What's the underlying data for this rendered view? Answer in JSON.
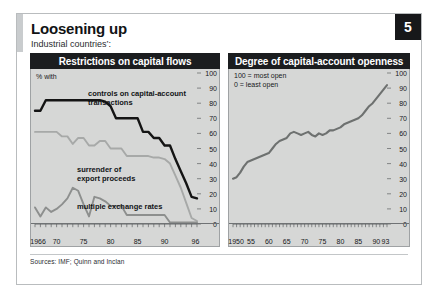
{
  "page": {
    "badge": "5",
    "title": "Loosening up",
    "subtitle": "Industrial countries’:",
    "source": "Sources: IMF; Quinn and Inclan"
  },
  "panels": {
    "left": {
      "header": "Restrictions on capital flows",
      "unit_note": "% with",
      "labels": {
        "controls": "controls on capital-account\ntransactions",
        "surrender": "surrender of\nexport proceeds",
        "multiple": "multiple exchange rates"
      }
    },
    "right": {
      "header": "Degree of capital-account openness",
      "scale_note": "100 = most open\n0 = least open"
    }
  },
  "chart_data": [
    {
      "type": "line",
      "title": "Restrictions on capital flows",
      "subtitle": "Industrial countries’:",
      "xlabel": "",
      "ylabel": "% with",
      "xlim": [
        1966,
        1996
      ],
      "ylim": [
        0,
        100
      ],
      "xticks": [
        1966,
        1970,
        1975,
        1980,
        1985,
        1990,
        1996
      ],
      "xtick_labels": [
        "1966",
        "70",
        "75",
        "80",
        "85",
        "90",
        "96"
      ],
      "yticks": [
        0,
        10,
        20,
        30,
        40,
        50,
        60,
        70,
        80,
        90,
        100
      ],
      "ytick_labels": [
        "0",
        "10",
        "20",
        "30",
        "40",
        "50",
        "60",
        "70",
        "80",
        "90",
        "100"
      ],
      "grid": false,
      "legend": "inline-annotations",
      "x": [
        1966,
        1967,
        1968,
        1969,
        1970,
        1971,
        1972,
        1973,
        1974,
        1975,
        1976,
        1977,
        1978,
        1979,
        1980,
        1981,
        1982,
        1983,
        1984,
        1985,
        1986,
        1987,
        1988,
        1989,
        1990,
        1991,
        1992,
        1993,
        1994,
        1995,
        1996
      ],
      "series": [
        {
          "name": "controls on capital-account transactions",
          "color": "#141414",
          "values": [
            75,
            75,
            82,
            82,
            82,
            82,
            82,
            82,
            82,
            82,
            82,
            82,
            82,
            81,
            78,
            70,
            70,
            70,
            70,
            70,
            61,
            61,
            57,
            57,
            52,
            52,
            43,
            35,
            27,
            18,
            17
          ]
        },
        {
          "name": "surrender of export proceeds",
          "color": "#a7a9a8",
          "values": [
            61,
            61,
            61,
            61,
            61,
            58,
            58,
            53,
            57,
            57,
            52,
            52,
            55,
            55,
            50,
            50,
            50,
            45,
            45,
            45,
            45,
            45,
            44,
            44,
            43,
            40,
            32,
            24,
            14,
            4,
            2
          ]
        },
        {
          "name": "multiple exchange rates",
          "color": "#8d8f8e",
          "values": [
            11,
            5,
            11,
            8,
            10,
            13,
            17,
            24,
            22,
            13,
            5,
            18,
            17,
            15,
            12,
            12,
            12,
            6,
            6,
            6,
            6,
            6,
            6,
            6,
            6,
            1,
            1,
            1,
            1,
            1,
            1
          ]
        }
      ]
    },
    {
      "type": "line",
      "title": "Degree of capital-account openness",
      "xlabel": "",
      "ylabel": "",
      "scale_note": "100 = most open / 0 = least open",
      "xlim": [
        1950,
        1993
      ],
      "ylim": [
        0,
        100
      ],
      "xticks": [
        1950,
        1955,
        1960,
        1965,
        1970,
        1975,
        1980,
        1985,
        1990,
        1993
      ],
      "xtick_labels": [
        "1950",
        "55",
        "60",
        "65",
        "70",
        "75",
        "80",
        "85",
        "90",
        "93"
      ],
      "yticks": [
        0,
        10,
        20,
        30,
        40,
        50,
        60,
        70,
        80,
        90,
        100
      ],
      "ytick_labels": [
        "0",
        "10",
        "20",
        "30",
        "40",
        "50",
        "60",
        "70",
        "80",
        "90",
        "100"
      ],
      "grid": false,
      "x": [
        1950,
        1951,
        1952,
        1953,
        1954,
        1955,
        1956,
        1957,
        1958,
        1959,
        1960,
        1961,
        1962,
        1963,
        1964,
        1965,
        1966,
        1967,
        1968,
        1969,
        1970,
        1971,
        1972,
        1973,
        1974,
        1975,
        1976,
        1977,
        1978,
        1979,
        1980,
        1981,
        1982,
        1983,
        1984,
        1985,
        1986,
        1987,
        1988,
        1989,
        1990,
        1991,
        1992,
        1993
      ],
      "series": [
        {
          "name": "Degree of capital-account openness",
          "color": "#6e7170",
          "values": [
            30,
            31,
            34,
            38,
            41,
            42,
            43,
            44,
            45,
            46,
            47,
            50,
            53,
            55,
            56,
            57,
            60,
            61,
            60,
            59,
            60,
            61,
            59,
            58,
            60,
            59,
            60,
            62,
            62,
            63,
            64,
            66,
            67,
            68,
            69,
            70,
            72,
            75,
            78,
            80,
            83,
            86,
            89,
            92
          ]
        }
      ]
    }
  ]
}
